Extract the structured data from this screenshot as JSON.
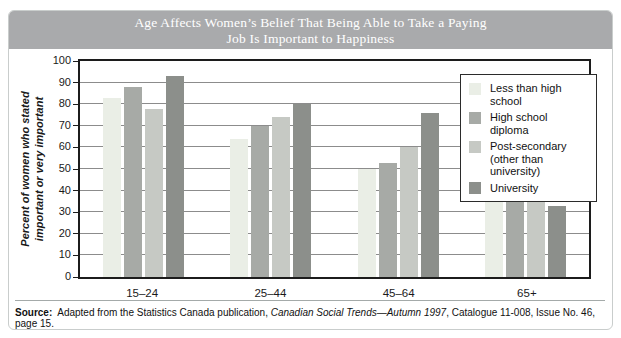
{
  "title": {
    "line1": "Age Affects Women’s Belief That Being Able to Take a Paying",
    "line2": "Job Is Important to Happiness"
  },
  "chart_data": {
    "type": "bar",
    "title": "Age Affects Women’s Belief That Being Able to Take a Paying Job Is Important to Happiness",
    "xlabel": "",
    "ylabel": "Percent of women who stated important or very important",
    "ylabel_line1": "Percent of women who stated",
    "ylabel_line2": "important or very important",
    "categories": [
      "15–24",
      "25–44",
      "45–64",
      "65+"
    ],
    "series": [
      {
        "name": "Less than high school",
        "legend_lines": [
          "Less than high school"
        ],
        "color": "#eaeee6",
        "values": [
          83,
          64,
          50,
          38
        ]
      },
      {
        "name": "High school diploma",
        "legend_lines": [
          "High school diploma"
        ],
        "color": "#a7aaa6",
        "values": [
          88,
          70,
          53,
          43
        ]
      },
      {
        "name": "Post-secondary (other than university)",
        "legend_lines": [
          "Post-secondary",
          "(other than university)"
        ],
        "color": "#c6c9c4",
        "values": [
          78,
          74,
          60,
          50
        ]
      },
      {
        "name": "University",
        "legend_lines": [
          "University"
        ],
        "color": "#8c8f8b",
        "values": [
          93,
          80,
          76,
          33
        ]
      }
    ],
    "ylim": [
      0,
      100
    ],
    "ytick_step": 10,
    "grid": true,
    "legend_position": "top-right"
  },
  "source": {
    "label": "Source:",
    "text_before_italic": "Adapted from the Statistics Canada publication, ",
    "italic": "Canadian Social Trends—Autumn 1997",
    "text_after_italic": ", Catalogue 11-008, Issue No. 46, page 15."
  },
  "colors": {
    "title_bar_bg": "#a9aaac",
    "title_text": "#ffffff",
    "plot_border": "#1c1c1c",
    "gridline": "#8c8c8c",
    "outer_border": "#c9cdcc",
    "axis_text": "#1a1a1a",
    "legend_border": "#2b2b2b"
  }
}
